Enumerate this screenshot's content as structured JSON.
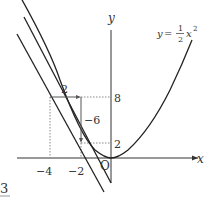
{
  "diagram": {
    "function_label": {
      "lhs": "y",
      "eq": "=",
      "num": "1",
      "den": "2",
      "var": "x",
      "exp": "2"
    },
    "axes": {
      "x_label": "x",
      "y_label": "y",
      "origin_label": "O"
    },
    "x_ticks": [
      "−4",
      "−2"
    ],
    "y_ticks": [
      "8",
      "2"
    ],
    "annotations": {
      "run": "2",
      "rise": "−6"
    },
    "corner_label": "3",
    "points": [
      {
        "x": -4,
        "y": 8
      },
      {
        "x": -2,
        "y": 2
      }
    ],
    "colors": {
      "line": "#222222",
      "dotted": "#888888",
      "text": "#333333"
    }
  }
}
